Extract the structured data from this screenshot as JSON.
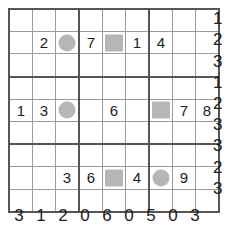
{
  "puzzle": {
    "type": "number-grid-puzzle",
    "rows": 9,
    "cols": 9,
    "block_size": 3,
    "colors": {
      "grid_line": "#9a9a9a",
      "block_line": "#555555",
      "marker_fill": "#b6b6b6",
      "text": "#1d1d1d",
      "background": "#ffffff"
    },
    "cells": [
      [
        {
          "value": "",
          "marker": ""
        },
        {
          "value": "",
          "marker": ""
        },
        {
          "value": "",
          "marker": ""
        },
        {
          "value": "",
          "marker": ""
        },
        {
          "value": "",
          "marker": ""
        },
        {
          "value": "",
          "marker": ""
        },
        {
          "value": "",
          "marker": ""
        },
        {
          "value": "",
          "marker": ""
        },
        {
          "value": "",
          "marker": ""
        }
      ],
      [
        {
          "value": "",
          "marker": ""
        },
        {
          "value": "2",
          "marker": ""
        },
        {
          "value": "",
          "marker": "circle"
        },
        {
          "value": "7",
          "marker": ""
        },
        {
          "value": "",
          "marker": "square"
        },
        {
          "value": "1",
          "marker": ""
        },
        {
          "value": "4",
          "marker": ""
        },
        {
          "value": "",
          "marker": ""
        },
        {
          "value": "",
          "marker": ""
        }
      ],
      [
        {
          "value": "",
          "marker": ""
        },
        {
          "value": "",
          "marker": ""
        },
        {
          "value": "",
          "marker": ""
        },
        {
          "value": "",
          "marker": ""
        },
        {
          "value": "",
          "marker": ""
        },
        {
          "value": "",
          "marker": ""
        },
        {
          "value": "",
          "marker": ""
        },
        {
          "value": "",
          "marker": ""
        },
        {
          "value": "",
          "marker": ""
        }
      ],
      [
        {
          "value": "",
          "marker": ""
        },
        {
          "value": "",
          "marker": ""
        },
        {
          "value": "",
          "marker": ""
        },
        {
          "value": "",
          "marker": ""
        },
        {
          "value": "",
          "marker": ""
        },
        {
          "value": "",
          "marker": ""
        },
        {
          "value": "",
          "marker": ""
        },
        {
          "value": "",
          "marker": ""
        },
        {
          "value": "",
          "marker": ""
        }
      ],
      [
        {
          "value": "1",
          "marker": ""
        },
        {
          "value": "3",
          "marker": ""
        },
        {
          "value": "",
          "marker": "circle"
        },
        {
          "value": "",
          "marker": ""
        },
        {
          "value": "6",
          "marker": ""
        },
        {
          "value": "",
          "marker": ""
        },
        {
          "value": "",
          "marker": "square"
        },
        {
          "value": "7",
          "marker": ""
        },
        {
          "value": "8",
          "marker": ""
        }
      ],
      [
        {
          "value": "",
          "marker": ""
        },
        {
          "value": "",
          "marker": ""
        },
        {
          "value": "",
          "marker": ""
        },
        {
          "value": "",
          "marker": ""
        },
        {
          "value": "",
          "marker": ""
        },
        {
          "value": "",
          "marker": ""
        },
        {
          "value": "",
          "marker": ""
        },
        {
          "value": "",
          "marker": ""
        },
        {
          "value": "",
          "marker": ""
        }
      ],
      [
        {
          "value": "",
          "marker": ""
        },
        {
          "value": "",
          "marker": ""
        },
        {
          "value": "",
          "marker": ""
        },
        {
          "value": "",
          "marker": ""
        },
        {
          "value": "",
          "marker": ""
        },
        {
          "value": "",
          "marker": ""
        },
        {
          "value": "",
          "marker": ""
        },
        {
          "value": "",
          "marker": ""
        },
        {
          "value": "",
          "marker": ""
        }
      ],
      [
        {
          "value": "",
          "marker": ""
        },
        {
          "value": "",
          "marker": ""
        },
        {
          "value": "3",
          "marker": ""
        },
        {
          "value": "6",
          "marker": ""
        },
        {
          "value": "",
          "marker": "square"
        },
        {
          "value": "4",
          "marker": ""
        },
        {
          "value": "",
          "marker": "circle"
        },
        {
          "value": "9",
          "marker": ""
        },
        {
          "value": "",
          "marker": ""
        }
      ],
      [
        {
          "value": "",
          "marker": ""
        },
        {
          "value": "",
          "marker": ""
        },
        {
          "value": "",
          "marker": ""
        },
        {
          "value": "",
          "marker": ""
        },
        {
          "value": "",
          "marker": ""
        },
        {
          "value": "",
          "marker": ""
        },
        {
          "value": "",
          "marker": ""
        },
        {
          "value": "",
          "marker": ""
        },
        {
          "value": "",
          "marker": ""
        }
      ]
    ],
    "row_clues": [
      "1",
      "2",
      "3",
      "1",
      "2",
      "3",
      "3",
      "2",
      "3"
    ],
    "col_clues": [
      "3",
      "1",
      "2",
      "0",
      "6",
      "0",
      "5",
      "0",
      "3"
    ]
  }
}
